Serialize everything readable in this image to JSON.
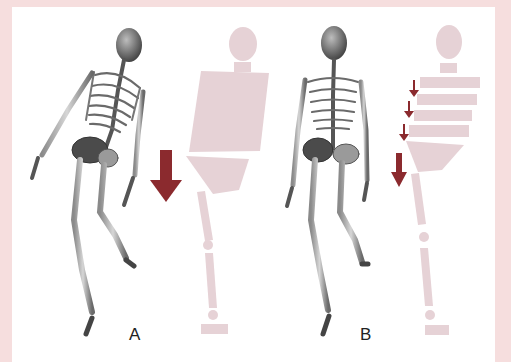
{
  "figure": {
    "panels": [
      {
        "id": "A",
        "label": "A",
        "description": "Skeleton leaning with a single large downward arrow beside a schematic with the torso as one rigid block"
      },
      {
        "id": "B",
        "label": "B",
        "description": "Skeleton upright with multiple small downward arrows beside a schematic with the torso split into stacked segments"
      }
    ]
  },
  "colors": {
    "frame": "#f6dede",
    "schematic": "#e6d2d6",
    "arrow": "#8b2a2e",
    "bone": "#6e6e6e",
    "bone_dark": "#3a3a3a"
  }
}
